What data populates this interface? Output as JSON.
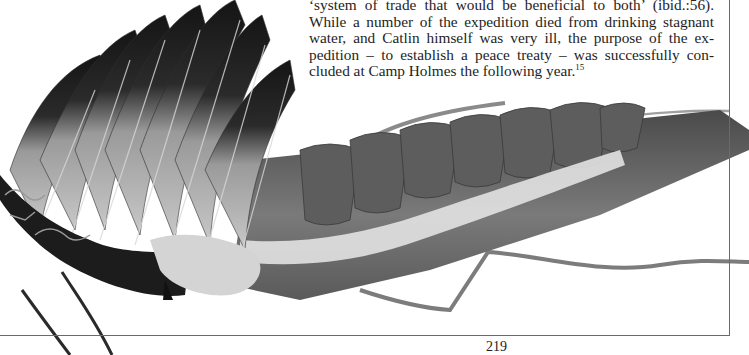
{
  "page": {
    "number": "219"
  },
  "body_text": {
    "lines": [
      "‘system of trade that would be beneficial to both’ (ibid.:56).",
      "While a number of the expedition died from drinking stagnant",
      "water, and Catlin himself was very ill, the purpose of the ex-",
      "pedition – to establish a peace treaty – was successfully con-",
      "cluded at Camp Holmes the following year."
    ],
    "footnote_ref": "15"
  },
  "figure": {
    "tone": "grayscale photograph",
    "colors": {
      "dark_feather": "#1a1a1a",
      "mid_feather": "#6b6b6b",
      "light_feather": "#bdbdbd",
      "fluff": "#e4e4e4",
      "trailer_cloth": "#5e5e5e",
      "frame_line": "#6a6a6a"
    }
  }
}
